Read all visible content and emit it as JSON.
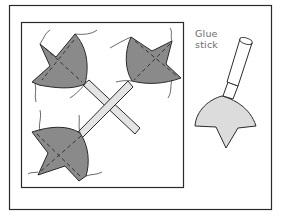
{
  "figure": {
    "labels": {
      "glue_line1": "Glue",
      "glue_line2": "stick"
    },
    "colors": {
      "outline": "#2a2a2a",
      "leaf_fill": "#8a8a8a",
      "stick_fill": "#e4e4e4",
      "glue_fill": "#dcdcdc",
      "background": "#ffffff",
      "label": "#6b6b6b"
    },
    "elements": [
      {
        "name": "outer-frame"
      },
      {
        "name": "inner-square"
      },
      {
        "name": "crossed-sticks",
        "count": 2
      },
      {
        "name": "leaf",
        "count": 3,
        "positions": [
          "top-left",
          "top-right",
          "bottom-left"
        ]
      },
      {
        "name": "glue-stick"
      }
    ]
  }
}
